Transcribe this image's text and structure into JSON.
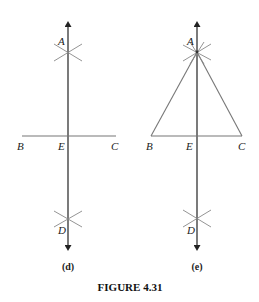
{
  "figure": {
    "caption": "FIGURE 4.31",
    "panels": [
      {
        "id": "d",
        "sublabel": "(d)",
        "points": {
          "A": "A",
          "B": "B",
          "C": "C",
          "D": "D",
          "E": "E"
        },
        "description": "Perpendicular bisector AD constructed through segment BC at E"
      },
      {
        "id": "e",
        "sublabel": "(e)",
        "points": {
          "A": "A",
          "B": "B",
          "C": "C",
          "D": "D",
          "E": "E"
        },
        "description": "Isosceles triangle ABC drawn with apex A on perpendicular bisector of BC"
      }
    ]
  }
}
